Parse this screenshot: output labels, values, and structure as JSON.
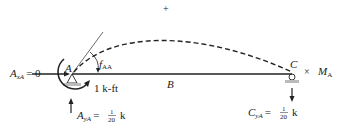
{
  "diagram": {
    "sign_convention": "+",
    "beam": {
      "points": [
        {
          "id": "A",
          "label": "A"
        },
        {
          "id": "B",
          "label": "B"
        },
        {
          "id": "C",
          "label": "C"
        }
      ]
    },
    "reactions": {
      "AxA": {
        "symbol": "A",
        "sub": "xA",
        "eq": "= 0"
      },
      "AyA": {
        "symbol": "A",
        "sub": "yA",
        "eq": "=",
        "num": "1",
        "den": "20",
        "unit": "k"
      },
      "CyA": {
        "symbol": "C",
        "sub": "yA",
        "eq": "=",
        "num": "1",
        "den": "20",
        "unit": "k"
      }
    },
    "applied_moment": {
      "label": "1 k-ft"
    },
    "rotation": {
      "symbol": "f",
      "sub": "AA"
    },
    "multiplier": {
      "times": "×",
      "symbol": "M",
      "sub": "A"
    },
    "colors": {
      "ink": "#222222",
      "support_fill": "#bbbbbb"
    }
  }
}
